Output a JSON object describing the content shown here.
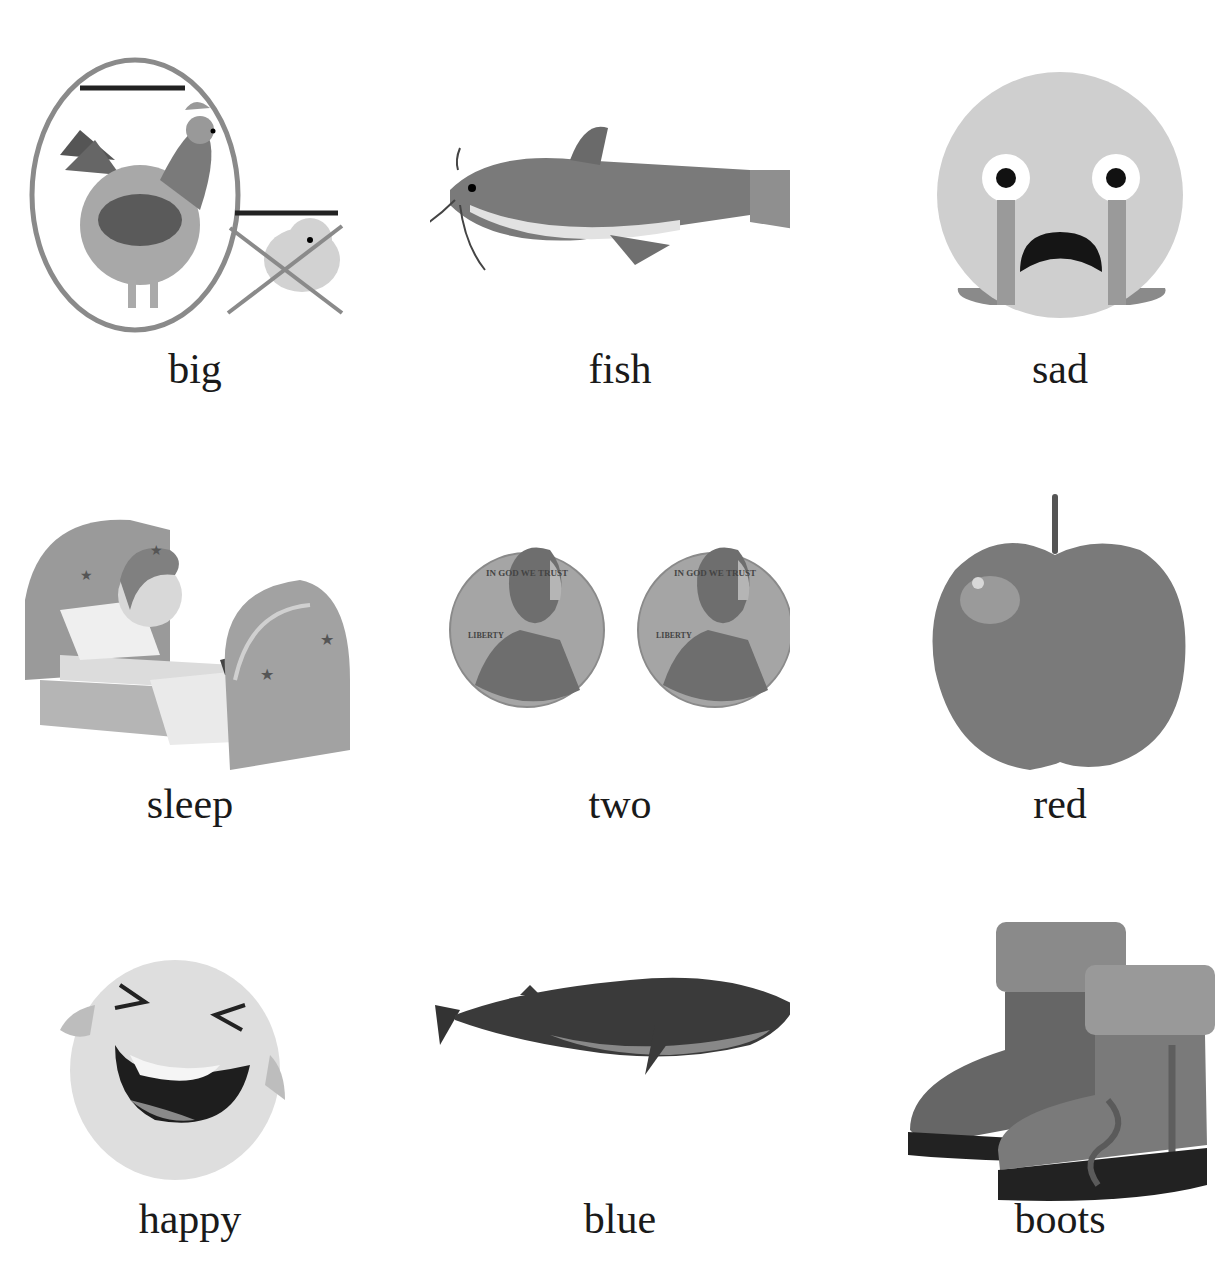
{
  "worksheet": {
    "cells": [
      {
        "word": "big",
        "picture": "rooster-vs-chick"
      },
      {
        "word": "fish",
        "picture": "catfish"
      },
      {
        "word": "sad",
        "picture": "crying-face"
      },
      {
        "word": "sleep",
        "picture": "child-sleeping-in-bed"
      },
      {
        "word": "two",
        "picture": "two-pennies"
      },
      {
        "word": "red",
        "picture": "apple"
      },
      {
        "word": "happy",
        "picture": "laughing-face"
      },
      {
        "word": "blue",
        "picture": "whale"
      },
      {
        "word": "boots",
        "picture": "pair-of-boots"
      }
    ],
    "coin_text": {
      "top": "IN GOD WE TRUST",
      "left": "LIBERTY"
    }
  }
}
